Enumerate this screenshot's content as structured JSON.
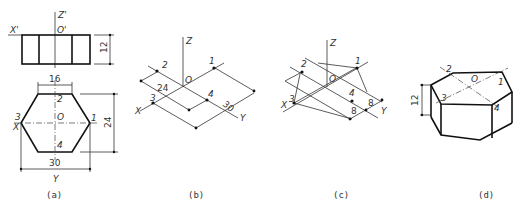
{
  "figure": {
    "panels": [
      {
        "id": "a",
        "caption": "(a)",
        "front_view": {
          "axis_labels": [
            "X'",
            "Z'",
            "O'"
          ],
          "height_dim": "12"
        },
        "top_view": {
          "points": [
            "1",
            "2",
            "3",
            "4"
          ],
          "origin": "O",
          "axis_labels": [
            "X",
            "Y"
          ],
          "dims": {
            "top_edge": "16",
            "width": "30",
            "depth": "24"
          }
        }
      },
      {
        "id": "b",
        "caption": "(b)",
        "points": [
          "1",
          "2",
          "3",
          "4"
        ],
        "origin": "O",
        "axis_labels": [
          "X",
          "Y",
          "Z"
        ],
        "dims": [
          "24",
          "30"
        ]
      },
      {
        "id": "c",
        "caption": "(c)",
        "points": [
          "1",
          "2",
          "3",
          "4"
        ],
        "origin": "O",
        "axis_labels": [
          "X",
          "Y",
          "Z"
        ],
        "dims": [
          "8",
          "8"
        ]
      },
      {
        "id": "d",
        "caption": "(d)",
        "points": [
          "1",
          "2",
          "3",
          "4"
        ],
        "origin": "O",
        "height_dim": "12"
      }
    ]
  }
}
